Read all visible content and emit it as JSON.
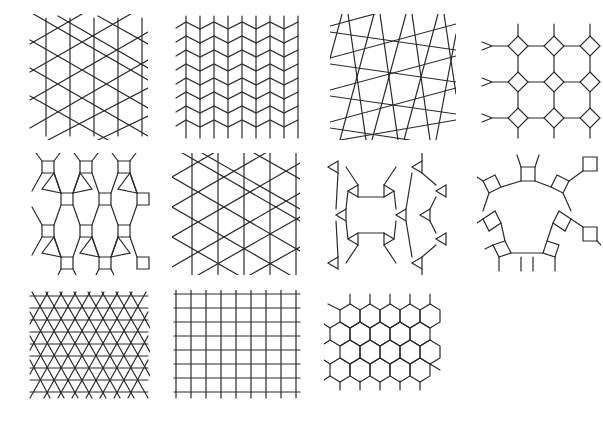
{
  "figure": {
    "line_color": "#2a2a2a",
    "background": "#ffffff",
    "panels": [
      {
        "id": "3.3.3.3.6",
        "name": "snub hexagonal",
        "row": 1,
        "col": 1
      },
      {
        "id": "3.3.3.4.4",
        "name": "elongated triangular",
        "row": 1,
        "col": 2
      },
      {
        "id": "3.3.4.3.4",
        "name": "snub square",
        "row": 1,
        "col": 3
      },
      {
        "id": "4.8.8",
        "name": "truncated square",
        "row": 1,
        "col": 4
      },
      {
        "id": "3.4.6.4",
        "name": "rhombitrihexagonal",
        "row": 2,
        "col": 1
      },
      {
        "id": "3.6.3.6",
        "name": "trihexagonal",
        "row": 2,
        "col": 2
      },
      {
        "id": "3.12.12",
        "name": "truncated hexagonal",
        "row": 2,
        "col": 3
      },
      {
        "id": "4.6.12",
        "name": "truncated trihexagonal",
        "row": 2,
        "col": 4
      },
      {
        "id": "3.3.3.3.3.3",
        "name": "triangular",
        "row": 3,
        "col": 1
      },
      {
        "id": "4.4.4.4",
        "name": "square",
        "row": 3,
        "col": 2
      },
      {
        "id": "6.6.6",
        "name": "hexagonal",
        "row": 3,
        "col": 3
      }
    ]
  }
}
